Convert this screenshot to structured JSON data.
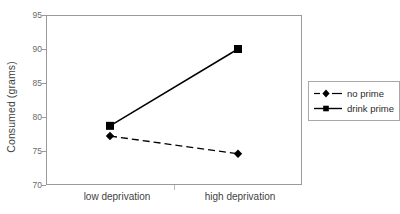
{
  "chart_data": {
    "type": "line",
    "title": "",
    "xlabel": "",
    "ylabel": "Consumed (grams)",
    "categories": [
      "low deprivation",
      "high deprivation"
    ],
    "ylim": [
      70,
      95
    ],
    "yticks": [
      70,
      75,
      80,
      85,
      90,
      95
    ],
    "grid": false,
    "legend_position": "right",
    "series": [
      {
        "name": "no prime",
        "values": [
          77.2,
          74.6
        ],
        "line_style": "dashed",
        "marker": "diamond",
        "color": "#000000"
      },
      {
        "name": "drink prime",
        "values": [
          78.7,
          90.0
        ],
        "line_style": "solid",
        "marker": "square",
        "color": "#000000"
      }
    ]
  },
  "axis": {
    "y_title": "Consumed (grams)",
    "y_tick_labels": [
      "95",
      "90",
      "85",
      "80",
      "75",
      "70"
    ],
    "x_tick_labels": [
      "low deprivation",
      "high deprivation"
    ]
  },
  "legend": {
    "entries": [
      {
        "label": "no prime"
      },
      {
        "label": "drink prime"
      }
    ]
  },
  "colors": {
    "series": "#000000",
    "frame": "#9a9a9a",
    "tick_text": "#6b6b6b",
    "label_text": "#3f3f3f",
    "background": "#ffffff"
  }
}
